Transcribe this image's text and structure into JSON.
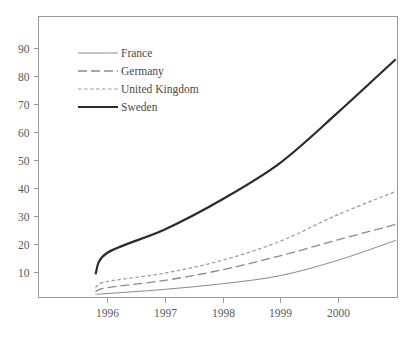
{
  "chart_data": {
    "type": "line",
    "title": "",
    "subtitle": "",
    "xlabel": "",
    "ylabel": "",
    "grid": false,
    "legend_position": "top-left",
    "x": [
      1995.8,
      1996,
      1997,
      1998,
      1999,
      2000,
      2001
    ],
    "xlim": [
      1995.8,
      2001
    ],
    "ylim": [
      0,
      100
    ],
    "xticks": [
      1996,
      1997,
      1998,
      1999,
      2000
    ],
    "xtick_labels": [
      "1996",
      "1997",
      "1998",
      "1999",
      "2000"
    ],
    "yticks": [
      10,
      20,
      30,
      40,
      50,
      60,
      70,
      80,
      90
    ],
    "ytick_labels": [
      "10",
      "20",
      "30",
      "40",
      "50",
      "60",
      "70",
      "80",
      "90"
    ],
    "series": [
      {
        "name": "France",
        "style": "solid-thin",
        "color": "#8a8a8a",
        "width": 1.0,
        "dash": "",
        "values": [
          2.0,
          2.3,
          3.8,
          5.8,
          8.7,
          14.2,
          21.3
        ]
      },
      {
        "name": "Germany",
        "style": "long-dash",
        "color": "#8a8a8a",
        "width": 1.3,
        "dash": "9 4",
        "values": [
          3.0,
          4.4,
          7.0,
          10.8,
          15.8,
          21.5,
          27.0
        ]
      },
      {
        "name": "United Kingdom",
        "style": "short-dash",
        "color": "#9a9a9a",
        "width": 1.2,
        "dash": "3.5 2.5",
        "values": [
          4.5,
          6.6,
          9.6,
          14.2,
          21.0,
          30.5,
          38.8
        ]
      },
      {
        "name": "Sweden",
        "style": "solid-thick",
        "color": "#2b2b2b",
        "width": 2.2,
        "dash": "",
        "values": [
          9.2,
          16.8,
          25.2,
          36.0,
          49.0,
          67.0,
          86.0
        ]
      }
    ]
  },
  "legend": {
    "items": [
      {
        "label": "France"
      },
      {
        "label": "Germany"
      },
      {
        "label": "United Kingdom"
      },
      {
        "label": "Sweden"
      }
    ]
  }
}
